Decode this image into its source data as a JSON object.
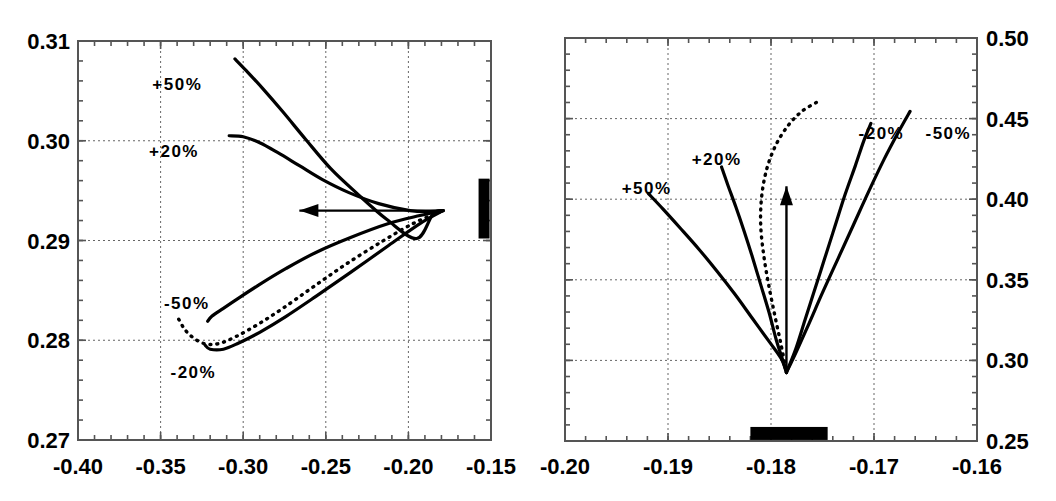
{
  "figure": {
    "title": "",
    "panels": [
      {
        "name": "left-panel",
        "xlabels": [
          "-0.40",
          "-0.35",
          "-0.30",
          "-0.25",
          "-0.20",
          "-0.15"
        ],
        "ylabels": [
          "0.31",
          "0.30",
          "0.29",
          "0.28",
          "0.27"
        ],
        "curve_labels": [
          "+50%",
          "+20%",
          "-50%",
          "-20%"
        ]
      },
      {
        "name": "right-panel",
        "xlabels": [
          "-0.20",
          "-0.19",
          "-0.18",
          "-0.17",
          "-0.16"
        ],
        "ylabels": [
          "0.50",
          "0.45",
          "0.40",
          "0.35",
          "0.30",
          "0.25"
        ],
        "curve_labels": [
          "+50%",
          "+20%",
          "-20%",
          "-50%"
        ]
      }
    ]
  },
  "chart_data": [
    {
      "type": "line",
      "name": "left-panel",
      "title": "",
      "xlabel": "",
      "ylabel": "",
      "xlim": [
        -0.4,
        -0.15
      ],
      "ylim": [
        0.27,
        0.31
      ],
      "xticks": [
        -0.4,
        -0.35,
        -0.3,
        -0.25,
        -0.2,
        -0.15
      ],
      "yticks": [
        0.27,
        0.28,
        0.29,
        0.3,
        0.31
      ],
      "grid": true,
      "legend": "inline-annotations",
      "convergence_point": [
        -0.179,
        0.293
      ],
      "annotations": [
        {
          "text": "+50%",
          "x": -0.355,
          "y": 0.3055
        },
        {
          "text": "+20%",
          "x": -0.357,
          "y": 0.2988
        },
        {
          "text": "-50%",
          "x": -0.348,
          "y": 0.2836
        },
        {
          "text": "-20%",
          "x": -0.344,
          "y": 0.2767
        }
      ],
      "arrow": {
        "from": [
          -0.179,
          0.293
        ],
        "to": [
          -0.266,
          0.293
        ],
        "style": "solid",
        "head": "to"
      },
      "marker_bar": {
        "x": -0.1545,
        "y_low": 0.2902,
        "y_high": 0.2962,
        "color": "#000000"
      },
      "series": [
        {
          "name": "+50%",
          "style": "solid",
          "points": [
            [
              -0.305,
              0.3082
            ],
            [
              -0.298,
              0.307
            ],
            [
              -0.288,
              0.3052
            ],
            [
              -0.276,
              0.3029
            ],
            [
              -0.262,
              0.3001
            ],
            [
              -0.247,
              0.2972
            ],
            [
              -0.231,
              0.2947
            ],
            [
              -0.213,
              0.2921
            ],
            [
              -0.195,
              0.2902
            ],
            [
              -0.185,
              0.2927
            ],
            [
              -0.179,
              0.293
            ]
          ]
        },
        {
          "name": "+20%",
          "style": "solid",
          "points": [
            [
              -0.3085,
              0.3005
            ],
            [
              -0.3,
              0.3004
            ],
            [
              -0.29,
              0.2998
            ],
            [
              -0.279,
              0.2988
            ],
            [
              -0.266,
              0.2975
            ],
            [
              -0.252,
              0.2961
            ],
            [
              -0.236,
              0.2948
            ],
            [
              -0.218,
              0.2937
            ],
            [
              -0.199,
              0.293
            ],
            [
              -0.187,
              0.2929
            ],
            [
              -0.179,
              0.293
            ]
          ]
        },
        {
          "name": "-50%",
          "style": "solid",
          "points": [
            [
              -0.3215,
              0.2819
            ],
            [
              -0.319,
              0.2824
            ],
            [
              -0.312,
              0.2832
            ],
            [
              -0.303,
              0.2842
            ],
            [
              -0.29,
              0.2856
            ],
            [
              -0.274,
              0.2872
            ],
            [
              -0.256,
              0.2888
            ],
            [
              -0.235,
              0.2903
            ],
            [
              -0.212,
              0.2917
            ],
            [
              -0.193,
              0.2925
            ],
            [
              -0.179,
              0.293
            ]
          ]
        },
        {
          "name": "-20%",
          "style": "solid",
          "points": [
            [
              -0.323,
              0.2795
            ],
            [
              -0.32,
              0.2791
            ],
            [
              -0.312,
              0.2791
            ],
            [
              -0.303,
              0.2797
            ],
            [
              -0.29,
              0.2808
            ],
            [
              -0.274,
              0.2824
            ],
            [
              -0.256,
              0.2844
            ],
            [
              -0.235,
              0.2868
            ],
            [
              -0.212,
              0.2895
            ],
            [
              -0.193,
              0.2917
            ],
            [
              -0.179,
              0.293
            ]
          ]
        },
        {
          "name": "reference",
          "style": "dotted",
          "points": [
            [
              -0.339,
              0.2821
            ],
            [
              -0.335,
              0.281
            ],
            [
              -0.329,
              0.2801
            ],
            [
              -0.322,
              0.2796
            ],
            [
              -0.314,
              0.2797
            ],
            [
              -0.304,
              0.2804
            ],
            [
              -0.291,
              0.2816
            ],
            [
              -0.276,
              0.2832
            ],
            [
              -0.258,
              0.2853
            ],
            [
              -0.238,
              0.2876
            ],
            [
              -0.216,
              0.2899
            ],
            [
              -0.196,
              0.2918
            ],
            [
              -0.179,
              0.293
            ]
          ]
        }
      ]
    },
    {
      "type": "line",
      "name": "right-panel",
      "title": "",
      "xlabel": "",
      "ylabel": "",
      "xlim": [
        -0.2,
        -0.16
      ],
      "ylim": [
        0.25,
        0.5
      ],
      "xticks": [
        -0.2,
        -0.19,
        -0.18,
        -0.17,
        -0.16
      ],
      "yticks": [
        0.25,
        0.3,
        0.35,
        0.4,
        0.45,
        0.5
      ],
      "grid": true,
      "legend": "inline-annotations",
      "convergence_point": [
        -0.1785,
        0.2925
      ],
      "annotations": [
        {
          "text": "+50%",
          "x": -0.1945,
          "y": 0.406
        },
        {
          "text": "+20%",
          "x": -0.1877,
          "y": 0.424
        },
        {
          "text": "-20%",
          "x": -0.1715,
          "y": 0.44
        },
        {
          "text": "-50%",
          "x": -0.165,
          "y": 0.44
        }
      ],
      "arrow": {
        "from": [
          -0.1785,
          0.2925
        ],
        "to": [
          -0.1785,
          0.408
        ],
        "style": "solid",
        "head": "to"
      },
      "marker_bar": {
        "x_low": -0.182,
        "x_high": -0.1745,
        "y": 0.255,
        "color": "#000000"
      },
      "series": [
        {
          "name": "+50%",
          "style": "solid",
          "points": [
            [
              -0.1919,
              0.4035
            ],
            [
              -0.1905,
              0.394
            ],
            [
              -0.1888,
              0.382
            ],
            [
              -0.187,
              0.369
            ],
            [
              -0.1852,
              0.355
            ],
            [
              -0.1835,
              0.341
            ],
            [
              -0.1818,
              0.326
            ],
            [
              -0.1801,
              0.311
            ],
            [
              -0.179,
              0.301
            ],
            [
              -0.1785,
              0.2925
            ]
          ]
        },
        {
          "name": "+20%",
          "style": "solid",
          "points": [
            [
              -0.1848,
              0.42
            ],
            [
              -0.1842,
              0.409
            ],
            [
              -0.1834,
              0.395
            ],
            [
              -0.1826,
              0.38
            ],
            [
              -0.1818,
              0.364
            ],
            [
              -0.181,
              0.347
            ],
            [
              -0.1802,
              0.33
            ],
            [
              -0.1795,
              0.313
            ],
            [
              -0.1789,
              0.301
            ],
            [
              -0.1785,
              0.2925
            ]
          ]
        },
        {
          "name": "-20%",
          "style": "solid",
          "points": [
            [
              -0.1703,
              0.447
            ],
            [
              -0.171,
              0.436
            ],
            [
              -0.1718,
              0.421
            ],
            [
              -0.1728,
              0.403
            ],
            [
              -0.1738,
              0.383
            ],
            [
              -0.1748,
              0.363
            ],
            [
              -0.1758,
              0.343
            ],
            [
              -0.1767,
              0.325
            ],
            [
              -0.1776,
              0.307
            ],
            [
              -0.1785,
              0.2925
            ]
          ]
        },
        {
          "name": "-50%",
          "style": "solid",
          "points": [
            [
              -0.1665,
              0.4545
            ],
            [
              -0.1676,
              0.442
            ],
            [
              -0.169,
              0.425
            ],
            [
              -0.1705,
              0.405
            ],
            [
              -0.172,
              0.384
            ],
            [
              -0.1735,
              0.363
            ],
            [
              -0.175,
              0.342
            ],
            [
              -0.1763,
              0.323
            ],
            [
              -0.1775,
              0.306
            ],
            [
              -0.1785,
              0.2925
            ]
          ]
        },
        {
          "name": "reference",
          "style": "dotted",
          "points": [
            [
              -0.1756,
              0.46
            ],
            [
              -0.177,
              0.4545
            ],
            [
              -0.1783,
              0.446
            ],
            [
              -0.1795,
              0.434
            ],
            [
              -0.1804,
              0.419
            ],
            [
              -0.1809,
              0.402
            ],
            [
              -0.181,
              0.384
            ],
            [
              -0.1807,
              0.365
            ],
            [
              -0.1802,
              0.346
            ],
            [
              -0.1796,
              0.327
            ],
            [
              -0.179,
              0.309
            ],
            [
              -0.1785,
              0.2925
            ]
          ]
        }
      ]
    }
  ]
}
